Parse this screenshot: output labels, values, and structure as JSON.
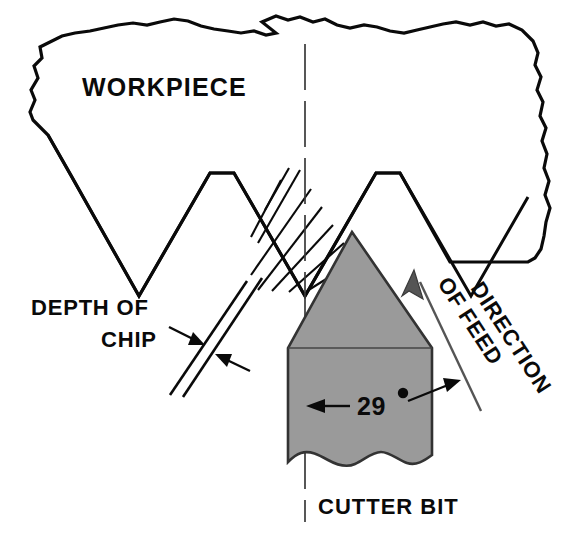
{
  "figure": {
    "type": "technical-diagram",
    "background_color": "#ffffff",
    "ink_color": "#0a0a0a",
    "bit_fill_color": "#9a9a9a",
    "feed_line_color": "#555555"
  },
  "labels": {
    "workpiece": "WORKPIECE",
    "depth_of_chip_line1": "DEPTH OF",
    "depth_of_chip_line2": "CHIP",
    "cutter_bit": "CUTTER BIT",
    "angle_value": "29",
    "angle_unit": "°",
    "direction_line1": "DIRECTION",
    "direction_line2": "OF",
    "direction_line3": "FEED"
  },
  "annotations": {
    "angle_degrees": 29,
    "angle_text": "29°",
    "feed_direction": "up-left",
    "feed_label_rotation_deg": 57,
    "chip_hatch_count": 9,
    "thread_teeth_visible": 4
  },
  "geometry": {
    "width": 577,
    "height": 539,
    "centerline_x": 305,
    "centerline_top_y": 44,
    "centerline_bottom_y": 522,
    "bit_apex": [
      352,
      232
    ],
    "bit_left_x": 288,
    "bit_right_x": 432,
    "bit_shoulder_y": 348,
    "bit_break_y": 465
  }
}
